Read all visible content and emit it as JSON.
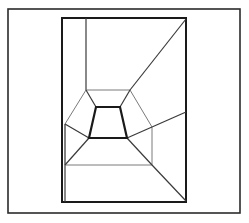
{
  "figure": {
    "canvas": {
      "width": 249,
      "height": 223,
      "background": "#ffffff"
    },
    "stroke_colors": {
      "frame": "#2b2b2b",
      "heavy": "#1a1a1a",
      "medium": "#3a3a3a",
      "light": "#7a7a7a"
    },
    "stroke_widths": {
      "frame": 1.6,
      "heavy": 2.2,
      "medium": 1.2,
      "light": 1.0
    },
    "outer_frame": {
      "x": 8,
      "y": 9,
      "width": 232,
      "height": 204
    },
    "inner_frame": {
      "x": 62,
      "y": 18,
      "width": 124,
      "height": 184
    },
    "center_polygon": {
      "label": "innermost-quadrilateral",
      "points": "96,107 120,107 127,138 89,138"
    },
    "mid_polygon": {
      "label": "middle-ring-polygon",
      "points": "86,90 130,90 152,127 152,165 65,165 65,124"
    },
    "connector_lines": [
      {
        "name": "corner-spoke-top-left",
        "x1": 86,
        "y1": 90,
        "x2": 96,
        "y2": 107
      },
      {
        "name": "corner-spoke-top-right",
        "x1": 130,
        "y1": 90,
        "x2": 120,
        "y2": 107
      },
      {
        "name": "corner-spoke-left",
        "x1": 65,
        "y1": 124,
        "x2": 89,
        "y2": 138
      },
      {
        "name": "corner-spoke-right",
        "x1": 152,
        "y1": 127,
        "x2": 127,
        "y2": 138
      },
      {
        "name": "corner-spoke-bottom-left",
        "x1": 65,
        "y1": 165,
        "x2": 89,
        "y2": 138
      },
      {
        "name": "corner-spoke-bottom-right",
        "x1": 152,
        "y1": 165,
        "x2": 127,
        "y2": 138
      }
    ],
    "frame_lines": [
      {
        "name": "vertical-edge-upper-left",
        "x1": 86,
        "y1": 18,
        "x2": 86,
        "y2": 90
      },
      {
        "name": "diagonal-upper-right",
        "x1": 186,
        "y1": 19,
        "x2": 130,
        "y2": 90
      },
      {
        "name": "diagonal-right-mid",
        "x1": 186,
        "y1": 112,
        "x2": 152,
        "y2": 127
      },
      {
        "name": "diagonal-lower-right",
        "x1": 186,
        "y1": 201,
        "x2": 152,
        "y2": 165
      },
      {
        "name": "vertical-edge-lower-left",
        "x1": 65,
        "y1": 165,
        "x2": 65,
        "y2": 202
      },
      {
        "name": "vertical-edge-left-upper",
        "x1": 65,
        "y1": 124,
        "x2": 65,
        "y2": 165
      }
    ]
  }
}
